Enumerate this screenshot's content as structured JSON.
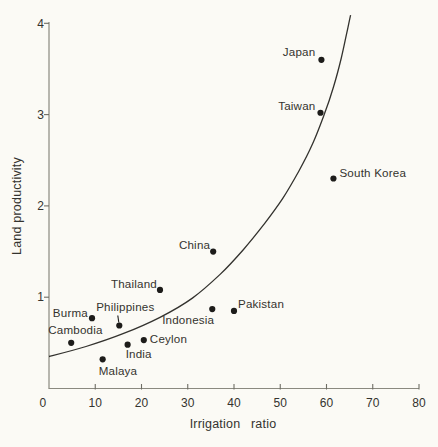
{
  "figure": {
    "width": 438,
    "height": 447,
    "background": "#fbfaf5",
    "ink": "#34332e",
    "dot_color": "#1d1c1a",
    "axis_color": "#8a897f",
    "tick_color": "#6e6d64",
    "curve_color": "#33322e"
  },
  "chart_data": {
    "type": "scatter",
    "title": "",
    "xlabel": "Irrigation ratio",
    "ylabel": "Land productivity",
    "xlim": [
      0,
      80
    ],
    "ylim": [
      0,
      4
    ],
    "x_ticks": [
      0,
      10,
      20,
      30,
      40,
      50,
      60,
      70,
      80
    ],
    "y_ticks": [
      1,
      2,
      3,
      4
    ],
    "grid": false,
    "legend": "none",
    "points": [
      {
        "label": "Japan",
        "x": 58.9,
        "y": 3.6,
        "anchor": "end",
        "dx": -6,
        "dy": -4
      },
      {
        "label": "Taiwan",
        "x": 58.7,
        "y": 3.02,
        "anchor": "end",
        "dx": -5,
        "dy": -3
      },
      {
        "label": "South Korea",
        "x": 61.5,
        "y": 2.3,
        "anchor": "start",
        "dx": 6,
        "dy": -2
      },
      {
        "label": "China",
        "x": 35.5,
        "y": 1.5,
        "anchor": "end",
        "dx": -3,
        "dy": -3
      },
      {
        "label": "Thailand",
        "x": 24.0,
        "y": 1.08,
        "anchor": "end",
        "dx": -3,
        "dy": -2
      },
      {
        "label": "Pakistan",
        "x": 40.0,
        "y": 0.85,
        "anchor": "start",
        "dx": 4,
        "dy": -3
      },
      {
        "label": "Indonesia",
        "x": 35.3,
        "y": 0.87,
        "anchor": "end",
        "dx": 2,
        "dy": 15
      },
      {
        "label": "Burma",
        "x": 9.3,
        "y": 0.77,
        "anchor": "end",
        "dx": -4,
        "dy": -1
      },
      {
        "label": "Philippines",
        "x": 15.2,
        "y": 0.69,
        "anchor": "middle",
        "dx": 6,
        "dy": -15,
        "leader": [
          -1.5,
          -10,
          -0.5,
          -3
        ]
      },
      {
        "label": "Cambodia",
        "x": 4.8,
        "y": 0.5,
        "anchor": "start",
        "dx": -23,
        "dy": -9
      },
      {
        "label": "Ceylon",
        "x": 20.5,
        "y": 0.53,
        "anchor": "start",
        "dx": 6,
        "dy": 3
      },
      {
        "label": "India",
        "x": 17.0,
        "y": 0.48,
        "anchor": "start",
        "dx": -2,
        "dy": 13
      },
      {
        "label": "Malaya",
        "x": 11.6,
        "y": 0.32,
        "anchor": "start",
        "dx": -4,
        "dy": 16
      }
    ],
    "curve": [
      [
        0,
        0.35
      ],
      [
        8,
        0.46
      ],
      [
        16,
        0.6
      ],
      [
        24,
        0.78
      ],
      [
        31,
        0.99
      ],
      [
        37,
        1.25
      ],
      [
        42,
        1.52
      ],
      [
        46.5,
        1.8
      ],
      [
        50.5,
        2.08
      ],
      [
        54,
        2.38
      ],
      [
        57,
        2.68
      ],
      [
        59.5,
        3.0
      ],
      [
        61.5,
        3.3
      ],
      [
        63.2,
        3.62
      ],
      [
        64.4,
        3.9
      ],
      [
        65.2,
        4.09
      ]
    ]
  }
}
